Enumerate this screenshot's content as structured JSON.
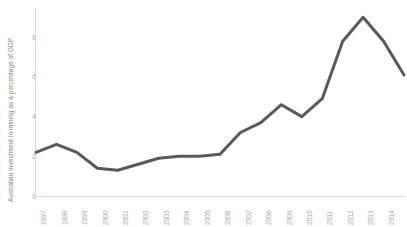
{
  "chart_data": {
    "type": "line",
    "title": "",
    "subtitle": "",
    "xlabel": "",
    "ylabel": "Australian investment in mining as a percentage of GDP",
    "categories": [
      "1997",
      "1998",
      "1999",
      "2000",
      "2001",
      "2002",
      "2003",
      "2004",
      "2005",
      "2006",
      "2007",
      "2008",
      "2009",
      "2010",
      "2011",
      "2012",
      "2013",
      "2014",
      "2015"
    ],
    "values": [
      2.2,
      2.6,
      2.2,
      1.4,
      1.3,
      1.6,
      1.9,
      2.0,
      2.0,
      2.1,
      3.2,
      3.7,
      4.6,
      4.0,
      4.9,
      7.8,
      9.0,
      7.8,
      6.1
    ],
    "series": [
      {
        "name": "Australian investment in mining as a percentage of GDP",
        "values": [
          2.2,
          2.6,
          2.2,
          1.4,
          1.3,
          1.6,
          1.9,
          2.0,
          2.0,
          2.1,
          3.2,
          3.7,
          4.6,
          4.0,
          4.9,
          7.8,
          9.0,
          7.8,
          6.1
        ]
      }
    ],
    "ylim": [
      0,
      9.6
    ],
    "yticks": [
      0,
      2,
      4,
      6,
      8
    ],
    "ytick_labels": [
      "0",
      "2",
      "4",
      "6",
      "8"
    ],
    "xlim_labels": [
      "1997",
      "2015"
    ],
    "grid": false,
    "legend": "none",
    "line_color": "#595959",
    "line_width": 3,
    "axis_color": "#d9d9d9",
    "tick_label_color": "#a6a6a6",
    "axis_title_color": "#808080",
    "background_color": "#ffffff"
  }
}
